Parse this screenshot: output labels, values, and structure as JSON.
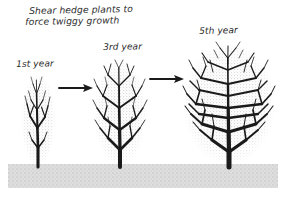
{
  "figure": {
    "kind": "hand-drawn-gardening-illustration",
    "title_line_1": "Shear hedge plants to",
    "title_line_2": "force twiggy growth",
    "background_color": "#ffffff",
    "ink_color": "#1a1a1a",
    "stipple_color": "#9a9a9a",
    "ground_color": "#d9d9d9",
    "width": 290,
    "height": 197
  },
  "stages": [
    {
      "label": "1st year",
      "order": 1,
      "description": "small narrow columnar shrub, sparse dark branches with light twiggy halo",
      "center_x": 38,
      "base_y": 166,
      "crown_top_y": 74,
      "crown_half_width": 17,
      "trunk_width": 2.6,
      "branch_levels": 3,
      "density": "sparse"
    },
    {
      "label": "3rd year",
      "order": 2,
      "description": "medium oval shrub, denser branching after shearing",
      "center_x": 120,
      "base_y": 166,
      "crown_top_y": 59,
      "crown_half_width": 26,
      "trunk_width": 3.4,
      "branch_levels": 4,
      "density": "medium"
    },
    {
      "label": "5th year",
      "order": 3,
      "description": "large full rounded shrub, very dense twiggy growth",
      "center_x": 229,
      "base_y": 166,
      "crown_top_y": 43,
      "crown_half_width": 46,
      "trunk_width": 4.4,
      "branch_levels": 5,
      "density": "dense"
    }
  ],
  "arrows": [
    {
      "name": "arrow-stage-1-to-2",
      "from_stage": "1st year",
      "to_stage": "3rd year",
      "x1": 59,
      "x2": 93,
      "y": 88,
      "direction": "right"
    },
    {
      "name": "arrow-stage-2-to-3",
      "from_stage": "3rd year",
      "to_stage": "5th year",
      "x1": 150,
      "x2": 184,
      "y": 79,
      "direction": "right"
    }
  ],
  "ground": {
    "name": "ground-band",
    "x": 8,
    "y": 164,
    "width": 270,
    "height": 24,
    "fill": "#d9d9d9",
    "texture": "stipple"
  }
}
